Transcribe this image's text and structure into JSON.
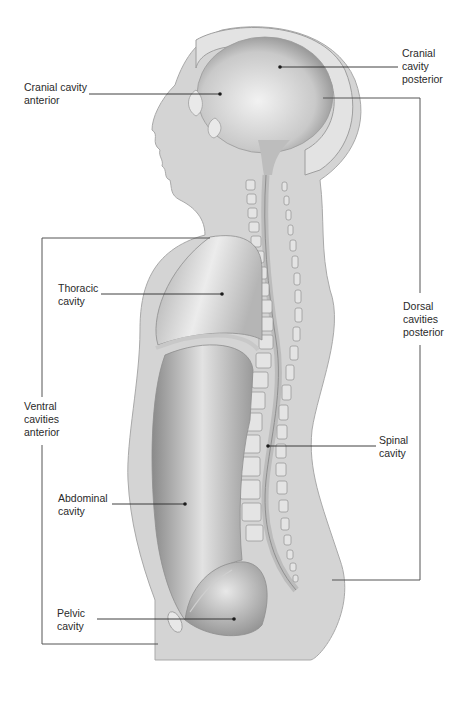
{
  "diagram": {
    "colors": {
      "body_fill": "#d4d4d4",
      "body_edge": "#a9a9a9",
      "cavity_light": "#e6e6e6",
      "cavity_dark": "#8f8f8f",
      "leader_line": "#2a2a2a",
      "bracket_line": "#555555"
    },
    "labels": {
      "cranial_anterior": "Cranial cavity\nanterior",
      "cranial_posterior": "Cranial\ncavity\nposterior",
      "thoracic": "Thoracic\ncavity",
      "ventral": "Ventral\ncavities\nanterior",
      "dorsal": "Dorsal\ncavities\nposterior",
      "spinal": "Spinal\ncavity",
      "abdominal": "Abdominal\ncavity",
      "pelvic": "Pelvic\ncavity"
    }
  }
}
